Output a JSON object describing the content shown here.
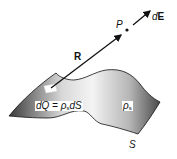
{
  "diagram": {
    "type": "surface charge electric field",
    "labels": {
      "point": "P",
      "field_element_prefix": "d",
      "field_element_vector": "E",
      "position_vector": "R",
      "charge_element": "dQ = ",
      "charge_density_symbol": "ρ",
      "charge_density_subscript": "s",
      "area_element": "dS",
      "surface_density_symbol": "ρ",
      "surface_density_subscript": "s",
      "surface_name": "S"
    },
    "colors": {
      "surface_dark": "#3a3a3a",
      "surface_light": "#f2f2f2",
      "stroke": "#111111",
      "background": "#ffffff"
    }
  }
}
